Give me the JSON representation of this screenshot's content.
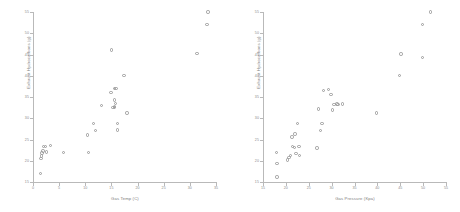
{
  "figure": {
    "background": "#ffffff",
    "marker_color": "#9a9a9a",
    "axis_color": "#b9b9b9",
    "text_color": "#8a8a8a"
  },
  "chart_data": [
    {
      "type": "scatter",
      "title": "",
      "xlabel": "Gas Temp (C)",
      "ylabel": "Exhaust Hydrocarbons (g)",
      "xlim": [
        0,
        35
      ],
      "ylim": [
        15,
        55
      ],
      "xticks": [
        0,
        5,
        10,
        15,
        20,
        25,
        30,
        35
      ],
      "yticks": [
        15,
        20,
        25,
        30,
        35,
        40,
        45,
        50,
        55
      ],
      "grid": false,
      "legend": null,
      "marker": "circle-open",
      "points": [
        {
          "x": 1.4,
          "y": 17.0
        },
        {
          "x": 1.5,
          "y": 20.5
        },
        {
          "x": 1.6,
          "y": 21.1
        },
        {
          "x": 1.7,
          "y": 21.8
        },
        {
          "x": 1.9,
          "y": 22.3
        },
        {
          "x": 2.0,
          "y": 23.3
        },
        {
          "x": 2.4,
          "y": 23.4
        },
        {
          "x": 2.6,
          "y": 22.1
        },
        {
          "x": 3.3,
          "y": 23.6
        },
        {
          "x": 5.8,
          "y": 22.0
        },
        {
          "x": 10.4,
          "y": 26.1
        },
        {
          "x": 10.6,
          "y": 22.0
        },
        {
          "x": 11.6,
          "y": 28.8
        },
        {
          "x": 12.0,
          "y": 27.1
        },
        {
          "x": 13.1,
          "y": 33.0
        },
        {
          "x": 15.0,
          "y": 46.1
        },
        {
          "x": 14.9,
          "y": 36.1
        },
        {
          "x": 15.6,
          "y": 37.0
        },
        {
          "x": 15.9,
          "y": 37.0
        },
        {
          "x": 15.6,
          "y": 34.3
        },
        {
          "x": 15.6,
          "y": 32.8
        },
        {
          "x": 15.8,
          "y": 33.5
        },
        {
          "x": 15.3,
          "y": 32.6
        },
        {
          "x": 15.6,
          "y": 32.6
        },
        {
          "x": 16.2,
          "y": 28.8
        },
        {
          "x": 16.2,
          "y": 27.2
        },
        {
          "x": 17.4,
          "y": 40.0
        },
        {
          "x": 18.0,
          "y": 31.2
        },
        {
          "x": 31.4,
          "y": 45.2
        },
        {
          "x": 33.3,
          "y": 52.0
        },
        {
          "x": 33.5,
          "y": 55.0
        }
      ]
    },
    {
      "type": "scatter",
      "title": "",
      "xlabel": "Gas Pressure (Kpa)",
      "ylabel": "Exhaust Hydrocarbons (g)",
      "xlim": [
        15,
        55
      ],
      "ylim": [
        15,
        55
      ],
      "xticks": [
        15,
        20,
        25,
        30,
        35,
        40,
        45,
        50,
        55
      ],
      "yticks": [
        15,
        20,
        25,
        30,
        35,
        40,
        45,
        50,
        55
      ],
      "grid": false,
      "legend": null,
      "marker": "circle-open",
      "points": [
        {
          "x": 18.1,
          "y": 16.2
        },
        {
          "x": 18.1,
          "y": 19.3
        },
        {
          "x": 17.9,
          "y": 22.0
        },
        {
          "x": 20.3,
          "y": 20.2
        },
        {
          "x": 20.7,
          "y": 20.8
        },
        {
          "x": 21.0,
          "y": 21.3
        },
        {
          "x": 21.4,
          "y": 23.3
        },
        {
          "x": 21.3,
          "y": 25.6
        },
        {
          "x": 22.0,
          "y": 26.3
        },
        {
          "x": 21.9,
          "y": 23.1
        },
        {
          "x": 22.6,
          "y": 28.8
        },
        {
          "x": 22.9,
          "y": 23.4
        },
        {
          "x": 23.0,
          "y": 21.2
        },
        {
          "x": 22.2,
          "y": 21.7
        },
        {
          "x": 26.8,
          "y": 23.0
        },
        {
          "x": 27.1,
          "y": 32.2
        },
        {
          "x": 27.6,
          "y": 27.1
        },
        {
          "x": 27.9,
          "y": 28.8
        },
        {
          "x": 28.2,
          "y": 36.5
        },
        {
          "x": 29.3,
          "y": 36.7
        },
        {
          "x": 29.9,
          "y": 35.6
        },
        {
          "x": 30.2,
          "y": 31.9
        },
        {
          "x": 30.5,
          "y": 33.2
        },
        {
          "x": 31.2,
          "y": 33.4
        },
        {
          "x": 31.4,
          "y": 33.3
        },
        {
          "x": 32.4,
          "y": 33.4
        },
        {
          "x": 39.8,
          "y": 31.2
        },
        {
          "x": 44.9,
          "y": 40.0
        },
        {
          "x": 45.2,
          "y": 45.1
        },
        {
          "x": 49.9,
          "y": 52.1
        },
        {
          "x": 49.8,
          "y": 44.3
        },
        {
          "x": 51.6,
          "y": 55.0
        }
      ]
    }
  ]
}
